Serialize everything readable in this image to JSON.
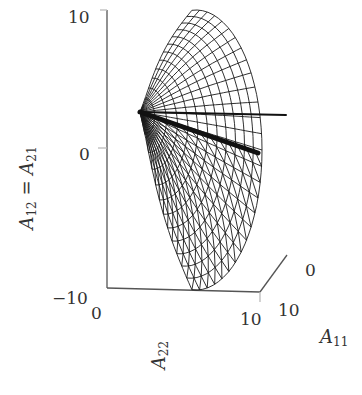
{
  "chart_data": {
    "type": "surface3d-wireframe",
    "title": "",
    "axes": {
      "x": {
        "label": "A11",
        "label_sub": "11",
        "label_base": "A",
        "range": [
          0,
          10
        ],
        "ticks": [
          "10",
          "0"
        ]
      },
      "y": {
        "label": "A22",
        "label_sub": "22",
        "label_base": "A",
        "range": [
          0,
          10
        ],
        "ticks": [
          "0",
          "10"
        ]
      },
      "z": {
        "label": "A12 = A21",
        "label_base": "A",
        "label_sub1": "12",
        "label_eq": " = ",
        "label_sub2": "21",
        "range": [
          -10,
          10
        ],
        "ticks": [
          "10",
          "0",
          "−10"
        ]
      }
    },
    "grid": false,
    "legend": null,
    "mesh": {
      "radial_lines": 28,
      "circular_rings": 12,
      "color": "#1a1a1a"
    },
    "highlight_rays": [
      {
        "name": "ray-horizontal",
        "width": 2
      },
      {
        "name": "ray-diagonal",
        "width": 5
      }
    ]
  },
  "labels": {
    "z_tick_top": "10",
    "z_tick_mid": "0",
    "z_tick_bottom": "−10",
    "y_tick_start": "0",
    "y_tick_end": "10",
    "x_tick_start": "10",
    "x_tick_end": "0",
    "z_label_a": "A",
    "z_label_sub1": "12",
    "z_label_eq": " = A",
    "z_label_sub2": "21",
    "y_label_a": "A",
    "y_label_sub": "22",
    "x_label_a": "A",
    "x_label_sub": "11"
  },
  "colors": {
    "axis": "#555555",
    "mesh": "#1a1a1a",
    "text": "#333333",
    "background": "#ffffff"
  }
}
